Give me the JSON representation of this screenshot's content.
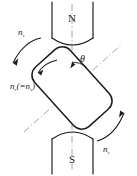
{
  "figure": {
    "background_color": "#ffffff",
    "line_color": "#1a1a1a",
    "axis_color": "#8c8c8c",
    "width": 137,
    "height": 176,
    "poles": {
      "north": {
        "label": "N",
        "position": "top",
        "face": "concave-bottom"
      },
      "south": {
        "label": "S",
        "position": "bottom",
        "face": "concave-top"
      }
    },
    "rotor": {
      "shape": "rounded-rectangle",
      "tilt_degrees": 32,
      "axis_style": "dash-dot"
    },
    "angle_label": {
      "symbol": "θ",
      "meaning": "torque angle between rotor axis and stator field axis"
    },
    "center_axis": {
      "style": "dash-dot",
      "orientation": "vertical"
    },
    "labels": [
      {
        "id": "ns-top-left",
        "base": "n",
        "subscript": "s",
        "text": "nₛ",
        "position": "top-left",
        "arrow": "curved-arrow-down-left"
      },
      {
        "id": "nr-equals-ns",
        "base": "n",
        "subscript": "r",
        "text": "nᵣ(=nₛ)",
        "paren_open": "(=",
        "paren_close": ")",
        "position": "middle-left",
        "arrow": "curved-arrow-down-left-short"
      },
      {
        "id": "ns-bottom-right",
        "base": "n",
        "subscript": "s",
        "text": "nₛ",
        "position": "bottom-right",
        "arrow": "curved-arrow-up-right"
      }
    ]
  }
}
